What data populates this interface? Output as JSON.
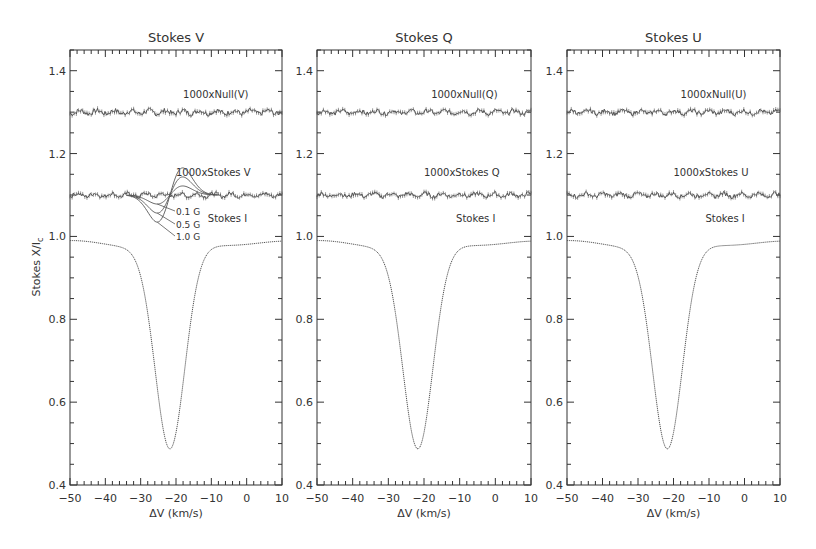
{
  "figure": {
    "ylabel": "Stokes X/I",
    "ylabel_sub": "c",
    "xlabel": "ΔV (km/s)"
  },
  "chart_data": [
    {
      "type": "line",
      "title": "Stokes V",
      "xlabel": "ΔV (km/s)",
      "ylabel": "Stokes X/Ic",
      "xlim": [
        -50,
        10
      ],
      "ylim": [
        0.4,
        1.45
      ],
      "xticks": [
        -50,
        -40,
        -30,
        -20,
        -10,
        0,
        10
      ],
      "yticks": [
        0.4,
        0.6,
        0.8,
        1.0,
        1.2,
        1.4
      ],
      "grid": false,
      "series": [
        {
          "name": "1000xNull(V)",
          "offset": 1.3,
          "noise": 0.006,
          "label_pos": [
            -17,
            1.335
          ]
        },
        {
          "name": "1000xStokes V",
          "offset": 1.1,
          "noise": 0.005,
          "label_pos": [
            -20,
            1.145
          ]
        },
        {
          "name": "Stokes I",
          "continuum": 0.98,
          "line_center": -21.7,
          "line_depth": 0.49,
          "label_pos": [
            -19,
            1.02
          ]
        }
      ],
      "models": [
        {
          "name": "0.1 G",
          "amplitude": 0.02
        },
        {
          "name": "0.5 G",
          "amplitude": 0.04
        },
        {
          "name": "1.0 G",
          "amplitude": 0.06
        }
      ]
    },
    {
      "type": "line",
      "title": "Stokes Q",
      "xlabel": "ΔV (km/s)",
      "xlim": [
        -50,
        10
      ],
      "ylim": [
        0.4,
        1.45
      ],
      "xticks": [
        -50,
        -40,
        -30,
        -20,
        -10,
        0,
        10
      ],
      "yticks": [
        0.4,
        0.6,
        0.8,
        1.0,
        1.2,
        1.4
      ],
      "series": [
        {
          "name": "1000xNull(Q)",
          "offset": 1.3,
          "noise": 0.005
        },
        {
          "name": "1000xStokes Q",
          "offset": 1.1,
          "noise": 0.005
        },
        {
          "name": "Stokes I",
          "continuum": 0.98,
          "line_center": -21.7,
          "line_depth": 0.49
        }
      ]
    },
    {
      "type": "line",
      "title": "Stokes U",
      "xlabel": "ΔV (km/s)",
      "xlim": [
        -50,
        10
      ],
      "ylim": [
        0.4,
        1.45
      ],
      "xticks": [
        -50,
        -40,
        -30,
        -20,
        -10,
        0,
        10
      ],
      "yticks": [
        0.4,
        0.6,
        0.8,
        1.0,
        1.2,
        1.4
      ],
      "series": [
        {
          "name": "1000xNull(U)",
          "offset": 1.3,
          "noise": 0.005
        },
        {
          "name": "1000xStokes U",
          "offset": 1.1,
          "noise": 0.005
        },
        {
          "name": "Stokes I",
          "continuum": 0.98,
          "line_center": -21.7,
          "line_depth": 0.49
        }
      ]
    }
  ],
  "layout": {
    "panels": [
      {
        "x0": 70,
        "x1": 282
      },
      {
        "x0": 317,
        "x1": 531
      },
      {
        "x0": 567,
        "x1": 780
      }
    ],
    "y_top": 50,
    "y_bottom": 485,
    "colors": {
      "axis": "#333333",
      "data": "#555555",
      "text": "#333333"
    }
  }
}
